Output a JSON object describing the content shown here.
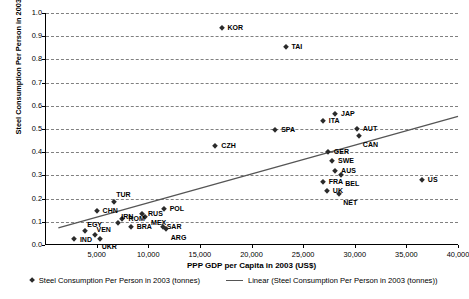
{
  "chart_data": {
    "type": "scatter",
    "title": "",
    "xlabel": "PPP GDP per Capita in 2003 (US$)",
    "ylabel": "Steel Consumption Per Person in 2003 (tonnes)",
    "xlim": [
      0,
      40000
    ],
    "ylim": [
      0,
      1.0
    ],
    "xticks": [
      5000,
      10000,
      15000,
      20000,
      25000,
      30000,
      35000,
      40000
    ],
    "xticklabels": [
      "5,000",
      "10,000",
      "15,000",
      "20,000",
      "25,000",
      "30,000",
      "35,000",
      "40,000"
    ],
    "yticks": [
      0.0,
      0.1,
      0.2,
      0.3,
      0.4,
      0.5,
      0.6,
      0.7,
      0.8,
      0.9,
      1.0
    ],
    "yticklabels": [
      "0.0",
      "0.1",
      "0.2",
      "0.3",
      "0.4",
      "0.5",
      "0.6",
      "0.7",
      "0.8",
      "0.9",
      "1.0"
    ],
    "grid": "horizontal-dashed",
    "legend_position": "bottom",
    "marker_color": "#2b2b2b",
    "trendline_color": "#555555",
    "points": [
      {
        "label": "KOR",
        "x": 17000,
        "y": 0.935,
        "lx": 6,
        "ly": -4
      },
      {
        "label": "TAI",
        "x": 23200,
        "y": 0.855,
        "lx": 6,
        "ly": -4
      },
      {
        "label": "JAP",
        "x": 28000,
        "y": 0.565,
        "lx": 6,
        "ly": -4
      },
      {
        "label": "ITA",
        "x": 26800,
        "y": 0.535,
        "lx": 6,
        "ly": -4
      },
      {
        "label": "AUT",
        "x": 30100,
        "y": 0.498,
        "lx": 6,
        "ly": -4
      },
      {
        "label": "SPA",
        "x": 22200,
        "y": 0.495,
        "lx": 6,
        "ly": -4
      },
      {
        "label": "CAN",
        "x": 30300,
        "y": 0.47,
        "lx": 4,
        "ly": 5
      },
      {
        "label": "CZH",
        "x": 16400,
        "y": 0.425,
        "lx": 6,
        "ly": -4
      },
      {
        "label": "GER",
        "x": 27300,
        "y": 0.4,
        "lx": 6,
        "ly": -4
      },
      {
        "label": "SWE",
        "x": 27700,
        "y": 0.362,
        "lx": 6,
        "ly": -4
      },
      {
        "label": "AUS",
        "x": 28000,
        "y": 0.317,
        "lx": 6,
        "ly": -4
      },
      {
        "label": "BEL",
        "x": 28600,
        "y": 0.3,
        "lx": 4,
        "ly": 5
      },
      {
        "label": "US",
        "x": 36400,
        "y": 0.282,
        "lx": 6,
        "ly": -4
      },
      {
        "label": "FRA",
        "x": 26800,
        "y": 0.272,
        "lx": 6,
        "ly": -4
      },
      {
        "label": "UK",
        "x": 27200,
        "y": 0.233,
        "lx": 6,
        "ly": -4
      },
      {
        "label": "NET",
        "x": 28400,
        "y": 0.22,
        "lx": 4,
        "ly": 5
      },
      {
        "label": "TUR",
        "x": 6600,
        "y": 0.186,
        "lx": 2,
        "ly": -11
      },
      {
        "label": "POL",
        "x": 11400,
        "y": 0.155,
        "lx": 6,
        "ly": -4
      },
      {
        "label": "CHN",
        "x": 4900,
        "y": 0.147,
        "lx": 6,
        "ly": -4
      },
      {
        "label": "RUS",
        "x": 9300,
        "y": 0.132,
        "lx": 6,
        "ly": -4
      },
      {
        "label": "MEX",
        "x": 9600,
        "y": 0.12,
        "lx": 6,
        "ly": 2
      },
      {
        "label": "ROM",
        "x": 7400,
        "y": 0.11,
        "lx": 6,
        "ly": -4
      },
      {
        "label": "IRN",
        "x": 7000,
        "y": 0.093,
        "lx": 3,
        "ly": -10
      },
      {
        "label": "BRA",
        "x": 8200,
        "y": 0.076,
        "lx": 6,
        "ly": -4
      },
      {
        "label": "SAR",
        "x": 11300,
        "y": 0.078,
        "lx": 4,
        "ly": -4
      },
      {
        "label": "ARG",
        "x": 11600,
        "y": 0.068,
        "lx": 5,
        "ly": 5
      },
      {
        "label": "EGY",
        "x": 3800,
        "y": 0.062,
        "lx": 2,
        "ly": -10
      },
      {
        "label": "VEN",
        "x": 4700,
        "y": 0.043,
        "lx": 2,
        "ly": -9
      },
      {
        "label": "IND",
        "x": 2700,
        "y": 0.025,
        "lx": 6,
        "ly": -3
      },
      {
        "label": "UKR",
        "x": 5200,
        "y": 0.025,
        "lx": 2,
        "ly": 4
      }
    ],
    "trendline": {
      "name": "Linear (Steel Consumption Per Person in 2003 (tonnes))",
      "x_start": 1200,
      "y_start": 0.07,
      "x_end": 40000,
      "y_end": 0.552
    },
    "legend": [
      {
        "label": "Steel Consumption Per Person in 2003 (tonnes)",
        "marker": "diamond-marker"
      },
      {
        "label": "Linear (Steel Consumption Per Person in 2003 (tonnes))",
        "marker": "line-marker"
      }
    ]
  }
}
